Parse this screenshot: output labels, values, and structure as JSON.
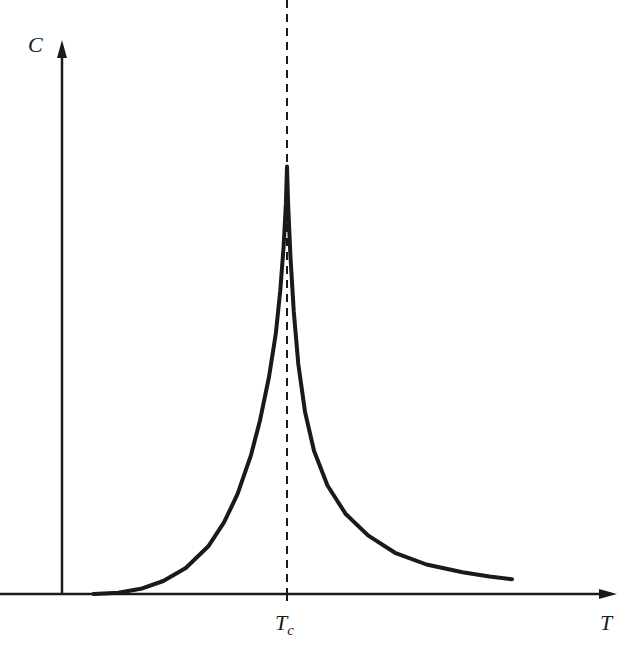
{
  "chart_data": {
    "type": "line",
    "title": "",
    "xlabel": "T",
    "ylabel": "C",
    "x_tick_labels": [
      {
        "base": "T",
        "sub": "c",
        "x": 1.0
      }
    ],
    "y_tick_labels": [],
    "xlim": [
      0.0,
      2.2
    ],
    "ylim": [
      0.0,
      1.1
    ],
    "grid": false,
    "legend": "none",
    "critical_line": {
      "x": 1.0,
      "style": "dashed",
      "label": "T_c"
    },
    "series": [
      {
        "name": "heat capacity C(T)",
        "color": "#1a1a1a",
        "x": [
          0.14,
          0.25,
          0.35,
          0.45,
          0.55,
          0.65,
          0.72,
          0.78,
          0.84,
          0.88,
          0.92,
          0.95,
          0.97,
          0.985,
          0.995,
          1.0,
          1.005,
          1.015,
          1.03,
          1.05,
          1.08,
          1.12,
          1.18,
          1.26,
          1.36,
          1.48,
          1.62,
          1.78,
          1.9,
          2.0
        ],
        "y": [
          0.0,
          0.003,
          0.012,
          0.03,
          0.06,
          0.11,
          0.165,
          0.23,
          0.32,
          0.4,
          0.5,
          0.6,
          0.7,
          0.8,
          0.9,
          0.985,
          0.9,
          0.78,
          0.65,
          0.53,
          0.42,
          0.33,
          0.25,
          0.185,
          0.135,
          0.095,
          0.068,
          0.05,
          0.04,
          0.034
        ]
      }
    ]
  }
}
